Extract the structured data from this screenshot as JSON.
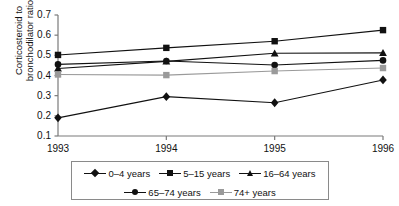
{
  "page": {
    "top_cutoff_artifact": "",
    "background": "#ffffff",
    "ink": "#111111"
  },
  "axes": {
    "y_label_line1": "Corticosteroid to",
    "y_label_line2": "bronchodilator ratio",
    "y_ticks": [
      "0.7",
      "0.6",
      "0.5",
      "0.4",
      "0.3",
      "0.2",
      "0.1"
    ],
    "x_ticks": [
      "1993",
      "1994",
      "1995",
      "1996"
    ]
  },
  "legend": {
    "row1": [
      {
        "label": "0–4 years",
        "marker": "diamond-marker",
        "color": "#111111"
      },
      {
        "label": "5–15 years",
        "marker": "square-marker",
        "color": "#111111"
      },
      {
        "label": "16–64 years",
        "marker": "triangle-marker",
        "color": "#111111"
      }
    ],
    "row2": [
      {
        "label": "65–74 years",
        "marker": "circle-marker",
        "color": "#111111"
      },
      {
        "label": "74+ years",
        "marker": "gray-square-marker",
        "color": "#9a9a9a"
      }
    ]
  },
  "chart_data": {
    "type": "line",
    "title": "",
    "xlabel": "",
    "ylabel": "Corticosteroid to bronchodilator ratio",
    "x": [
      "1993",
      "1994",
      "1995",
      "1996"
    ],
    "ylim": [
      0.1,
      0.7
    ],
    "ytick_step": 0.1,
    "grid": false,
    "legend_position": "bottom",
    "series": [
      {
        "name": "0–4 years",
        "marker": "diamond",
        "color": "#111111",
        "values": [
          0.19,
          0.295,
          0.265,
          0.378
        ]
      },
      {
        "name": "5–15 years",
        "marker": "square",
        "color": "#111111",
        "values": [
          0.502,
          0.537,
          0.57,
          0.625
        ]
      },
      {
        "name": "16–64 years",
        "marker": "triangle",
        "color": "#111111",
        "values": [
          0.435,
          0.47,
          0.51,
          0.512
        ]
      },
      {
        "name": "65–74 years",
        "marker": "circle",
        "color": "#111111",
        "values": [
          0.455,
          0.472,
          0.452,
          0.475
        ]
      },
      {
        "name": "74+ years",
        "marker": "square",
        "color": "#9a9a9a",
        "values": [
          0.405,
          0.402,
          0.422,
          0.437
        ]
      }
    ]
  }
}
